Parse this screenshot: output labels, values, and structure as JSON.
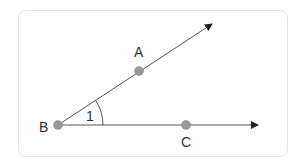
{
  "diagram": {
    "type": "angle",
    "points": {
      "A": {
        "label": "A",
        "x": 139,
        "y": 71
      },
      "B": {
        "label": "B",
        "x": 58,
        "y": 125
      },
      "C": {
        "label": "C",
        "x": 186,
        "y": 125
      }
    },
    "angle_label": "1",
    "rays": [
      "BA",
      "BC"
    ],
    "colors": {
      "line": "#555555",
      "point": "#999999",
      "border": "#e6e6e6"
    }
  }
}
